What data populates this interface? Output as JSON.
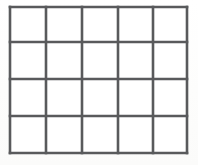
{
  "figure": {
    "canvas": {
      "width": 198,
      "height": 165,
      "background_color": "#fdfdfc"
    },
    "grid": {
      "columns": 5,
      "rows": 4,
      "cell_count": 20,
      "line_color": "#595a5c",
      "line_width": 2.6,
      "cell_fill": "#ffffff",
      "bounds": {
        "left": 10,
        "top": 7,
        "right": 187,
        "bottom": 153,
        "width": 177,
        "height": 146
      },
      "vertical_lines_x": [
        10,
        46,
        82,
        118,
        153,
        187
      ],
      "horizontal_lines_y": [
        7,
        42,
        79,
        116,
        153
      ],
      "column_widths": [
        36,
        36,
        36,
        35,
        34
      ],
      "row_heights": [
        35,
        37,
        37,
        37
      ]
    }
  },
  "chart_data": {
    "type": "table",
    "title": "",
    "xlabel": "",
    "ylabel": "",
    "columns": 5,
    "rows": 4,
    "column_headers": [
      "",
      "",
      "",
      "",
      ""
    ],
    "values": [
      [
        "",
        "",
        "",
        "",
        ""
      ],
      [
        "",
        "",
        "",
        "",
        ""
      ],
      [
        "",
        "",
        "",
        "",
        ""
      ],
      [
        "",
        "",
        "",
        "",
        ""
      ]
    ],
    "grid": true,
    "legend": "none"
  }
}
